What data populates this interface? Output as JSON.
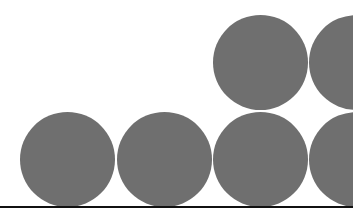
{
  "diagram": {
    "colors": {
      "circle_fill": "#6f6f6f",
      "baseline": "#111111",
      "background": "#ffffff"
    },
    "circle_diameter": 95,
    "circles": [
      {
        "id": "bottom-1",
        "row": "bottom",
        "cx": 67,
        "cy": 159
      },
      {
        "id": "bottom-2",
        "row": "bottom",
        "cx": 164,
        "cy": 159
      },
      {
        "id": "bottom-3",
        "row": "bottom",
        "cx": 260,
        "cy": 159
      },
      {
        "id": "bottom-4",
        "row": "bottom",
        "cx": 356,
        "cy": 159
      },
      {
        "id": "top-1",
        "row": "top",
        "cx": 260,
        "cy": 62
      },
      {
        "id": "top-2",
        "row": "top",
        "cx": 356,
        "cy": 62
      }
    ],
    "baseline": {
      "y": 206,
      "x_end": 353,
      "thickness": 2
    }
  }
}
